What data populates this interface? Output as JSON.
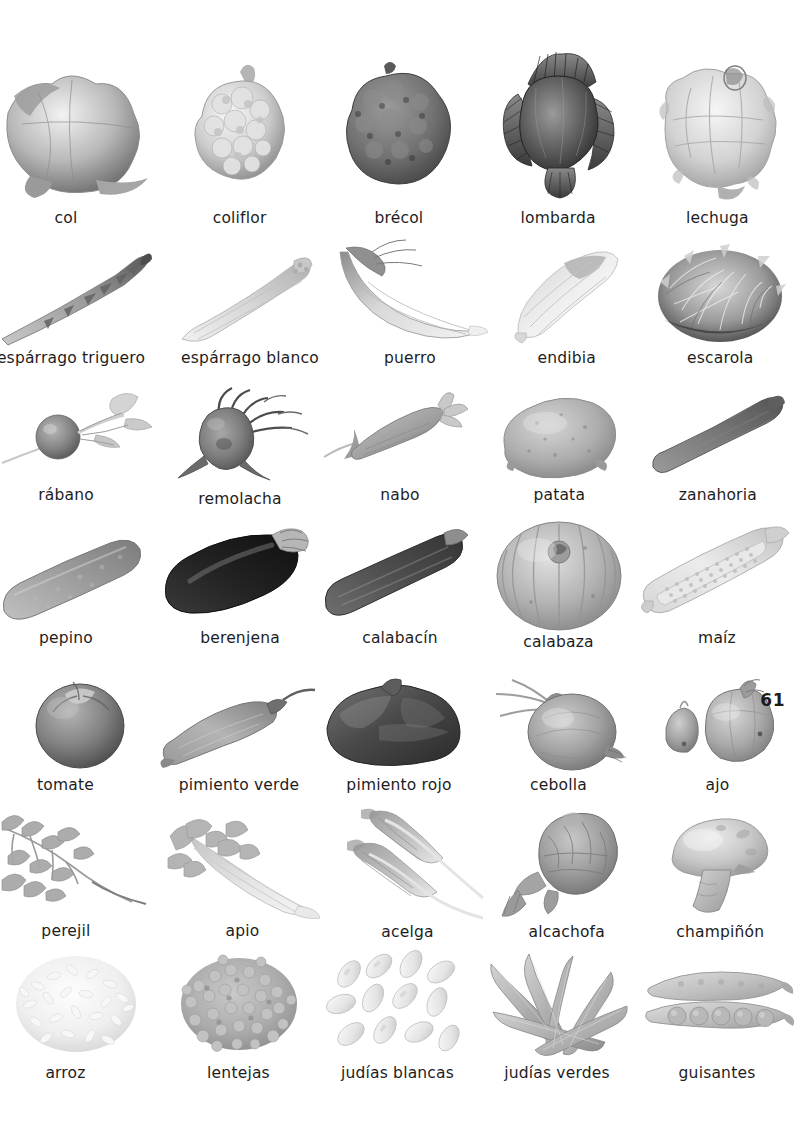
{
  "page": {
    "number": "61",
    "language": "es",
    "topic": "verduras-hortalizas-legumbres"
  },
  "rows": [
    {
      "items": [
        {
          "label": "col",
          "icon": "cabbage-icon",
          "cropped": true
        },
        {
          "label": "coliflor",
          "icon": "cauliflower-icon",
          "cropped": false
        },
        {
          "label": "brécol",
          "icon": "broccoli-icon",
          "cropped": false
        },
        {
          "label": "lombarda",
          "icon": "red-cabbage-icon",
          "cropped": false
        },
        {
          "label": "lechuga",
          "icon": "lettuce-icon",
          "cropped": false
        }
      ]
    },
    {
      "items": [
        {
          "label": "espárrago triguero",
          "icon": "green-asparagus-icon",
          "cropped": true
        },
        {
          "label": "espárrago blanco",
          "icon": "white-asparagus-icon",
          "cropped": false
        },
        {
          "label": "puerro",
          "icon": "leek-icon",
          "cropped": false
        },
        {
          "label": "endibia",
          "icon": "endive-icon",
          "cropped": false
        },
        {
          "label": "escarola",
          "icon": "escarole-icon",
          "cropped": false
        }
      ]
    },
    {
      "items": [
        {
          "label": "rábano",
          "icon": "radish-icon",
          "cropped": true
        },
        {
          "label": "remolacha",
          "icon": "beetroot-icon",
          "cropped": false
        },
        {
          "label": "nabo",
          "icon": "turnip-icon",
          "cropped": false
        },
        {
          "label": "patata",
          "icon": "potato-icon",
          "cropped": false
        },
        {
          "label": "zanahoria",
          "icon": "carrot-icon",
          "cropped": false
        }
      ]
    },
    {
      "items": [
        {
          "label": "pepino",
          "icon": "cucumber-icon",
          "cropped": true
        },
        {
          "label": "berenjena",
          "icon": "eggplant-icon",
          "cropped": false
        },
        {
          "label": "calabacín",
          "icon": "zucchini-icon",
          "cropped": false
        },
        {
          "label": "calabaza",
          "icon": "pumpkin-icon",
          "cropped": false
        },
        {
          "label": "maíz",
          "icon": "corn-icon",
          "cropped": false
        }
      ]
    },
    {
      "items": [
        {
          "label": "tomate",
          "icon": "tomato-icon",
          "cropped": true
        },
        {
          "label": "pimiento verde",
          "icon": "green-pepper-icon",
          "cropped": false
        },
        {
          "label": "pimiento rojo",
          "icon": "red-pepper-icon",
          "cropped": false
        },
        {
          "label": "cebolla",
          "icon": "onion-icon",
          "cropped": false
        },
        {
          "label": "ajo",
          "icon": "garlic-icon",
          "cropped": false
        }
      ]
    },
    {
      "items": [
        {
          "label": "perejil",
          "icon": "parsley-icon",
          "cropped": true
        },
        {
          "label": "apio",
          "icon": "celery-icon",
          "cropped": false
        },
        {
          "label": "acelga",
          "icon": "chard-icon",
          "cropped": false
        },
        {
          "label": "alcachofa",
          "icon": "artichoke-icon",
          "cropped": false
        },
        {
          "label": "champiñón",
          "icon": "mushroom-icon",
          "cropped": false
        }
      ]
    },
    {
      "items": [
        {
          "label": "arroz",
          "icon": "rice-icon",
          "cropped": true
        },
        {
          "label": "lentejas",
          "icon": "lentils-icon",
          "cropped": false
        },
        {
          "label": "judías blancas",
          "icon": "white-beans-icon",
          "cropped": false
        },
        {
          "label": "judías verdes",
          "icon": "green-beans-icon",
          "cropped": false
        },
        {
          "label": "guisantes",
          "icon": "peas-icon",
          "cropped": false
        }
      ]
    }
  ],
  "colors": {
    "page_background": "#ffffff",
    "label_text": "#1d1d1d",
    "page_number_text": "#1b1b1b",
    "art_light": "#f2f2f2",
    "art_mid": "#b9b9b9",
    "art_dark": "#6d6d6d"
  }
}
